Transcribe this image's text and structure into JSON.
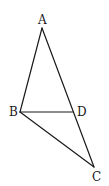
{
  "diagram": {
    "type": "geometry-figure",
    "points": [
      {
        "name": "A",
        "x": 42,
        "y": 28,
        "label_x": 38,
        "label_y": 24
      },
      {
        "name": "B",
        "x": 20,
        "y": 112,
        "label_x": 9,
        "label_y": 116
      },
      {
        "name": "D",
        "x": 73,
        "y": 112,
        "label_x": 77,
        "label_y": 116
      },
      {
        "name": "C",
        "x": 94,
        "y": 167,
        "label_x": 92,
        "label_y": 181
      }
    ],
    "segments": [
      {
        "from": "A",
        "to": "B"
      },
      {
        "from": "A",
        "to": "C"
      },
      {
        "from": "B",
        "to": "D"
      },
      {
        "from": "B",
        "to": "C"
      }
    ],
    "labels": {
      "A": "A",
      "B": "B",
      "C": "C",
      "D": "D"
    },
    "stroke_color": "#1a1a1a"
  }
}
